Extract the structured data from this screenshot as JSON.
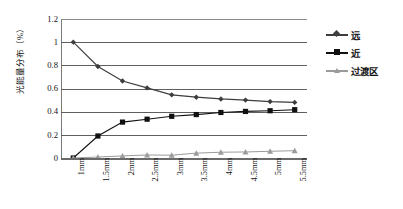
{
  "chart_data": {
    "type": "line",
    "title": "",
    "xlabel": "",
    "ylabel": "光能量分布（%）",
    "categories": [
      "1mm",
      "1.5mm",
      "2mm",
      "2.5mm",
      "3mm",
      "3.5mm",
      "4mm",
      "4.5mm",
      "5mm",
      "5.5mm"
    ],
    "ylim": [
      0,
      1.2
    ],
    "ytick_labels": [
      "1.2",
      "1",
      "0.8",
      "0.6",
      "0.4",
      "0.2",
      "0"
    ],
    "ytick_values": [
      1.2,
      1.0,
      0.8,
      0.6,
      0.4,
      0.2,
      0
    ],
    "grid": true,
    "legend_position": "right",
    "series": [
      {
        "name": "远",
        "marker": "diamond",
        "color": "#3d3d3d",
        "values": [
          1.0,
          0.79,
          0.665,
          0.605,
          0.545,
          0.525,
          0.51,
          0.5,
          0.487,
          0.48
        ]
      },
      {
        "name": "近",
        "marker": "square",
        "color": "#111111",
        "values": [
          0.0,
          0.19,
          0.31,
          0.335,
          0.36,
          0.375,
          0.393,
          0.402,
          0.408,
          0.417
        ]
      },
      {
        "name": "过渡区",
        "marker": "triangle",
        "color": "#9b9b9b",
        "values": [
          0.0,
          0.008,
          0.018,
          0.026,
          0.024,
          0.042,
          0.05,
          0.052,
          0.058,
          0.063
        ]
      }
    ]
  },
  "legend": {
    "items": [
      {
        "label": "远"
      },
      {
        "label": "近"
      },
      {
        "label": "过渡区"
      }
    ]
  }
}
